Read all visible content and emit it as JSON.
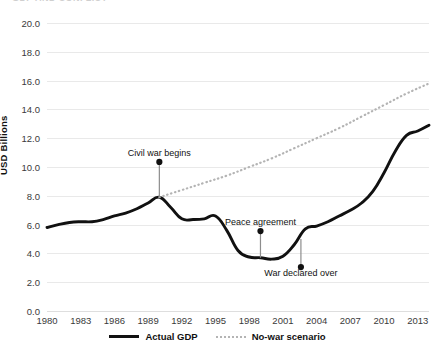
{
  "chart_data": {
    "type": "line",
    "title": "",
    "xlabel": "",
    "ylabel": "USD Billions",
    "ylim": [
      0,
      20
    ],
    "xlim": [
      1980,
      2014
    ],
    "ytick_labels": [
      "0.0",
      "2.0",
      "4.0",
      "6.0",
      "8.0",
      "10.0",
      "12.0",
      "14.0",
      "16.0",
      "18.0",
      "20.0"
    ],
    "ytick_values": [
      0,
      2,
      4,
      6,
      8,
      10,
      12,
      14,
      16,
      18,
      20
    ],
    "xtick_labels": [
      "1980",
      "1983",
      "1986",
      "1989",
      "1992",
      "1995",
      "1998",
      "2001",
      "2004",
      "2007",
      "2010",
      "2013"
    ],
    "xtick_values": [
      1980,
      1983,
      1986,
      1989,
      1992,
      1995,
      1998,
      2001,
      2004,
      2007,
      2010,
      2013
    ],
    "grid": true,
    "legend_position": "bottom",
    "series": [
      {
        "name": "Actual GDP",
        "style": "solid",
        "color": "#111111",
        "x": [
          1980,
          1981,
          1982,
          1983,
          1984,
          1985,
          1986,
          1987,
          1988,
          1989,
          1990,
          1991,
          1992,
          1993,
          1994,
          1995,
          1996,
          1997,
          1998,
          1999,
          2000,
          2001,
          2002,
          2003,
          2004,
          2005,
          2006,
          2007,
          2008,
          2009,
          2010,
          2011,
          2012,
          2013,
          2014
        ],
        "values": [
          5.8,
          6.0,
          6.15,
          6.2,
          6.2,
          6.35,
          6.6,
          6.8,
          7.1,
          7.5,
          7.9,
          7.2,
          6.4,
          6.35,
          6.4,
          6.6,
          5.6,
          4.2,
          3.75,
          3.7,
          3.6,
          3.8,
          4.6,
          5.7,
          5.9,
          6.2,
          6.6,
          7.0,
          7.5,
          8.3,
          9.6,
          11.1,
          12.2,
          12.5,
          12.9
        ]
      },
      {
        "name": "No-war scenario",
        "style": "dotted",
        "color": "#b4b4b4",
        "x": [
          1990,
          1992,
          1994,
          1996,
          1998,
          2000,
          2002,
          2004,
          2006,
          2008,
          2010,
          2012,
          2014
        ],
        "values": [
          7.9,
          8.4,
          8.9,
          9.4,
          10.0,
          10.6,
          11.3,
          12.0,
          12.7,
          13.5,
          14.3,
          15.1,
          15.8
        ]
      }
    ],
    "annotations": [
      {
        "id": "civil-war-begins",
        "text": "Civil war begins",
        "label_x": 1990,
        "label_y": 10.9,
        "dot_x": 1990,
        "dot_y": 10.35,
        "target_x": 1990,
        "target_y": 7.9
      },
      {
        "id": "peace-agreement",
        "text": "Peace agreement",
        "label_x": 1999,
        "label_y": 6.1,
        "dot_x": 1999,
        "dot_y": 5.55,
        "target_x": 1999,
        "target_y": 3.7
      },
      {
        "id": "war-declared-over",
        "text": "War declared over",
        "label_x": 2002.6,
        "label_y": 2.55,
        "dot_x": 2002.6,
        "dot_y": 3.05,
        "target_x": 2002.6,
        "target_y": 5.0
      }
    ]
  },
  "legend": {
    "items": [
      {
        "label": "Actual GDP",
        "style": "solid"
      },
      {
        "label": "No-war scenario",
        "style": "dotted"
      }
    ]
  },
  "axis": {
    "y_title": "USD Billions"
  },
  "title_sliver": "GDP AND CONFLICT"
}
